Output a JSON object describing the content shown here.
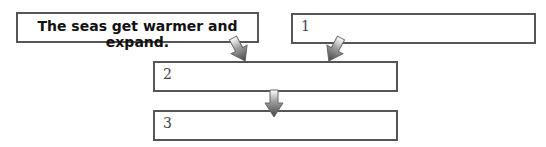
{
  "diagram": {
    "boxes": [
      {
        "id": "given",
        "text": "The seas get warmer and expand."
      },
      {
        "id": "box1",
        "text": "1"
      },
      {
        "id": "box2",
        "text": "2"
      },
      {
        "id": "box3",
        "text": "3"
      }
    ],
    "arrows": [
      {
        "from": "given",
        "to": "box2"
      },
      {
        "from": "box1",
        "to": "box2"
      },
      {
        "from": "box2",
        "to": "box3"
      }
    ],
    "colors": {
      "border": "#555555",
      "arrow_dark": "#555555",
      "arrow_light": "#ffffff"
    }
  }
}
